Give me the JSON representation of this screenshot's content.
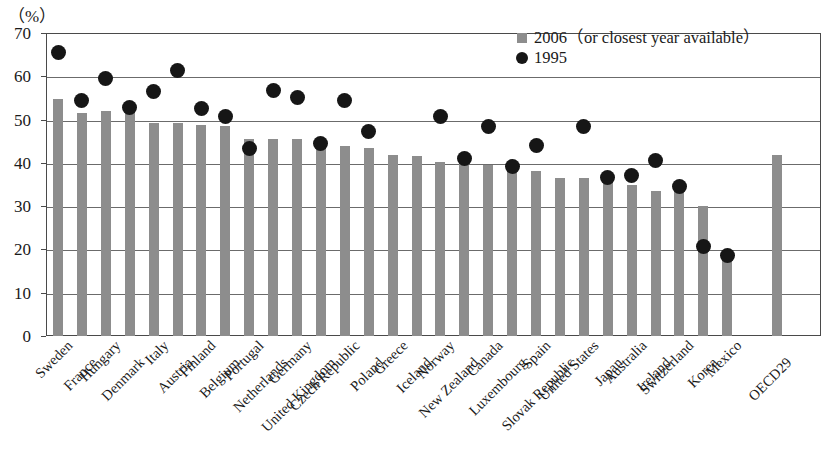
{
  "unit_label": "（%）",
  "legend": {
    "position": "top-right",
    "entries": [
      {
        "label": "2006（or closest year available）",
        "marker": "square",
        "color": "#8d8d8d"
      },
      {
        "label": "1995",
        "marker": "circle",
        "color": "#161616"
      }
    ]
  },
  "chart_data": {
    "type": "bar",
    "title": "",
    "subtitle": "",
    "xlabel": "",
    "ylabel": "（%）",
    "ylim": [
      0,
      70
    ],
    "ytick_labels": [
      "0",
      "10",
      "20",
      "30",
      "40",
      "50",
      "60",
      "70"
    ],
    "yticks": [
      0,
      10,
      20,
      30,
      40,
      50,
      60,
      70
    ],
    "grid": "horizontal",
    "categories": [
      "Sweden",
      "France",
      "Hungary",
      "Denmark",
      "Italy",
      "Austria",
      "Finland",
      "Belgium",
      "Portugal",
      "Netherlands",
      "Germany",
      "United Kingdom",
      "Czech Republic",
      "Poland",
      "Greece",
      "Iceland",
      "Norway",
      "New Zealand",
      "Canada",
      "Luxembourg",
      "Spain",
      "Slovak Republic",
      "United States",
      "Japan",
      "Australia",
      "Ireland",
      "Switzerland",
      "Korea",
      "Mexico",
      "OECD29"
    ],
    "series": [
      {
        "name": "2006（or closest year available）",
        "marker": "bar",
        "color": "#8d8d8d",
        "values": [
          54.7,
          51.6,
          51.9,
          51.8,
          49.3,
          49.1,
          48.7,
          48.5,
          45.6,
          45.5,
          45.4,
          44.3,
          43.8,
          43.5,
          41.9,
          41.6,
          40.2,
          40.0,
          39.4,
          38.9,
          38.2,
          36.5,
          36.5,
          35.6,
          34.8,
          33.4,
          33.5,
          30.0,
          18.8,
          41.8
        ]
      },
      {
        "name": "1995",
        "marker": "circle",
        "color": "#161616",
        "values": [
          65.5,
          54.5,
          59.5,
          52.8,
          56.5,
          61.3,
          52.6,
          50.7,
          43.3,
          56.8,
          55.0,
          44.5,
          54.4,
          47.3,
          null,
          null,
          50.6,
          41.1,
          48.3,
          39.1,
          44.0,
          null,
          48.5,
          36.7,
          37.0,
          40.5,
          34.5,
          20.6,
          18.7,
          null
        ]
      }
    ]
  }
}
